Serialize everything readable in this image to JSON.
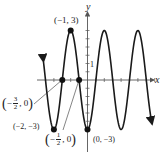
{
  "figure": {
    "axes": {
      "x_label": "x",
      "y_label": "y",
      "y_tick_label": "1"
    },
    "function": "y = -3cos(πx)",
    "points": [
      {
        "name": "max",
        "label": "(−1, 3)",
        "x": -1,
        "y": 3
      },
      {
        "name": "min-left",
        "label": "(−2, −3)",
        "x": -2,
        "y": -3
      },
      {
        "name": "min-origin",
        "label": "(0, −3)",
        "x": 0,
        "y": -3
      },
      {
        "name": "zero-left",
        "x": -1.5,
        "y": 0,
        "label_sign": "−",
        "label_num": "3",
        "label_den": "2",
        "label_rest": ", 0"
      },
      {
        "name": "zero-right",
        "x": -0.5,
        "y": 0,
        "label_sign": "−",
        "label_num": "1",
        "label_den": "2",
        "label_rest": ", 0"
      }
    ],
    "colors": {
      "curve": "#1a1a1a",
      "axis": "#555555"
    }
  }
}
